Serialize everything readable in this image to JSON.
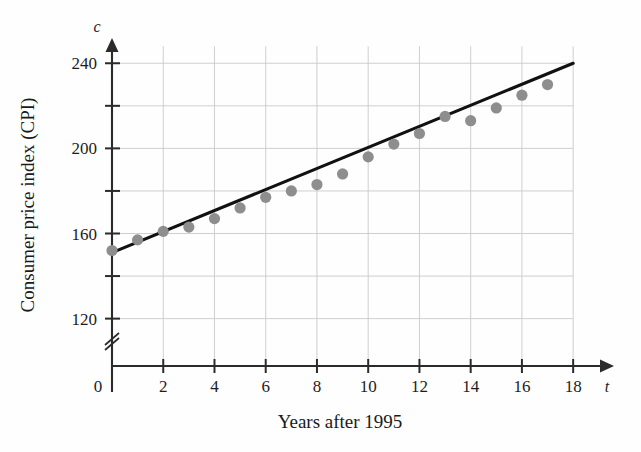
{
  "figure": {
    "background_color": "#fefefe",
    "point_color": "#8e8e8e",
    "line_color": "#111111",
    "grid_color": "#c9c9c9",
    "axis_color": "#2b2b2b"
  },
  "axes": {
    "x_variable_symbol": "t",
    "y_variable_symbol": "c",
    "x_title": "Years after 1995",
    "y_title": "Consumer price index (CPI)",
    "origin_label": "0",
    "x_tick_labels": [
      "2",
      "4",
      "6",
      "8",
      "10",
      "12",
      "14",
      "16",
      "18"
    ],
    "y_tick_labels": [
      "240",
      "200",
      "160",
      "120"
    ],
    "axis_break_symbol": "//"
  },
  "chart_data": {
    "type": "scatter",
    "title": "",
    "xlabel": "Years after 1995",
    "ylabel": "Consumer price index (CPI)",
    "xlim": [
      0,
      18
    ],
    "ylim": [
      120,
      250
    ],
    "y_axis_broken_below": 120,
    "grid": true,
    "grid_x_step": 2,
    "grid_y_step": 20,
    "x_ticks": [
      0,
      2,
      4,
      6,
      8,
      10,
      12,
      14,
      16,
      18
    ],
    "x_tick_labels_shown": [
      2,
      4,
      6,
      8,
      10,
      12,
      14,
      16,
      18
    ],
    "y_ticks": [
      120,
      140,
      160,
      180,
      200,
      220,
      240
    ],
    "y_tick_labels_shown": [
      120,
      160,
      200,
      240
    ],
    "legend": null,
    "series": [
      {
        "name": "Consumer price index",
        "marker": "filled-circle",
        "color": "#8e8e8e",
        "x": [
          0,
          1,
          2,
          3,
          4,
          5,
          6,
          7,
          8,
          9,
          10,
          11,
          12,
          13,
          14,
          15,
          16,
          17
        ],
        "y": [
          152,
          157,
          161,
          163,
          167,
          172,
          177,
          180,
          183,
          188,
          196,
          202,
          207,
          215,
          213,
          219,
          225,
          230
        ]
      },
      {
        "name": "Line of best fit",
        "type": "line",
        "color": "#111111",
        "x": [
          0,
          18
        ],
        "y": [
          151,
          240
        ]
      }
    ]
  }
}
